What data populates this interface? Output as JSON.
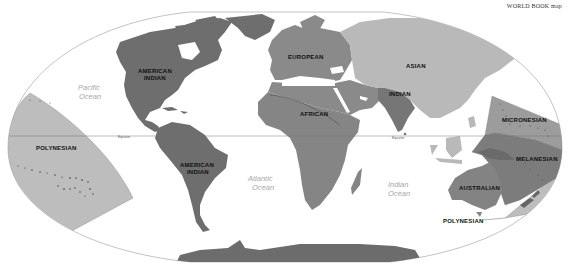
{
  "map": {
    "credit": "WORLD BOOK map",
    "projection": "oval world projection",
    "colors": {
      "background": "#ffffff",
      "ocean": "#ffffff",
      "outline": "#9a9a9a",
      "american_indian": "#6e6e6e",
      "european": "#8a8a8a",
      "african": "#858585",
      "asian": "#b9b9b9",
      "indian": "#767676",
      "australian": "#838383",
      "polynesian": "#bdbdbd",
      "micronesian": "#9c9c9c",
      "melanesian": "#7c7c7c",
      "antarctica": "#6c6c6c",
      "label_text": "#111111",
      "ocean_text": "#a8a8a8"
    },
    "regions": [
      {
        "id": "american_indian_north",
        "label": "AMERICAN INDIAN"
      },
      {
        "id": "american_indian_south",
        "label": "AMERICAN INDIAN"
      },
      {
        "id": "european",
        "label": "EUROPEAN"
      },
      {
        "id": "african",
        "label": "AFRICAN"
      },
      {
        "id": "asian",
        "label": "ASIAN"
      },
      {
        "id": "indian",
        "label": "INDIAN"
      },
      {
        "id": "australian",
        "label": "AUSTRALIAN"
      },
      {
        "id": "micronesian",
        "label": "MICRONESIAN"
      },
      {
        "id": "melanesian",
        "label": "MELANESIAN"
      },
      {
        "id": "polynesian_west",
        "label": "POLYNESIAN"
      },
      {
        "id": "polynesian_east",
        "label": "POLYNESIAN"
      }
    ],
    "labels": {
      "american_indian_north_1": "AMERICAN",
      "american_indian_north_2": "INDIAN",
      "american_indian_south_1": "AMERICAN",
      "american_indian_south_2": "INDIAN",
      "european": "EUROPEAN",
      "african": "AFRICAN",
      "asian": "ASIAN",
      "indian": "INDIAN",
      "australian": "AUSTRALIAN",
      "micronesian": "MICRONESIAN",
      "melanesian": "MELANESIAN",
      "polynesian_left": "POLYNESIAN",
      "polynesian_right": "POLYNESIAN"
    },
    "oceans": {
      "pacific_1": "Pacific",
      "pacific_2": "Ocean",
      "atlantic_1": "Atlantic",
      "atlantic_2": "Ocean",
      "indian_1": "Indian",
      "indian_2": "Ocean"
    },
    "equator": {
      "label_west": "Equator",
      "label_east": "Equator"
    }
  }
}
